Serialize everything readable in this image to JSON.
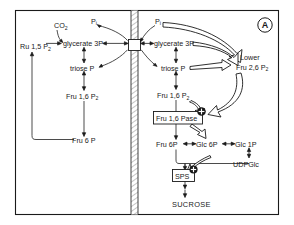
{
  "figure": {
    "panel_letter": "A",
    "title_text": "",
    "compartments": {
      "left_name": "chloroplast stroma",
      "right_name": "cytosol",
      "divider_name": "chloroplast envelope membrane"
    }
  },
  "metabolites": {
    "left": [
      {
        "id": "ru15p2",
        "label": "Ru 1,5 P",
        "sub": "2",
        "x": 20,
        "y": 46
      },
      {
        "id": "co2",
        "label": "CO",
        "sub": "2",
        "x": 56,
        "y": 26
      },
      {
        "id": "pi_left",
        "label": "P",
        "sub": "i",
        "x": 93,
        "y": 21
      },
      {
        "id": "glycerate3p_left",
        "label": "glycerate 3P",
        "sub": "",
        "x": 65,
        "y": 46
      },
      {
        "id": "triosep_left",
        "label": "triose P",
        "sub": "",
        "x": 74,
        "y": 70
      },
      {
        "id": "fru16p2_left",
        "label": "Fru 1,6 P",
        "sub": "2",
        "x": 72,
        "y": 98
      },
      {
        "id": "fru6p_left",
        "label": "Fru 6 P",
        "sub": "",
        "x": 76,
        "y": 142
      }
    ],
    "right": [
      {
        "id": "pi_right",
        "label": "P",
        "sub": "i",
        "x": 157,
        "y": 21
      },
      {
        "id": "glycerate3p_right",
        "label": "glycerate 3P",
        "sub": "",
        "x": 155,
        "y": 46
      },
      {
        "id": "triosep_right",
        "label": "triose P",
        "sub": "",
        "x": 163,
        "y": 70
      },
      {
        "id": "fru16p2_right",
        "label": "Fru 1,6 P",
        "sub": "2",
        "x": 163,
        "y": 97
      },
      {
        "id": "fru6p_right",
        "label": "Fru 6P",
        "sub": "",
        "x": 161,
        "y": 146
      },
      {
        "id": "glc6p",
        "label": "Glc 6P",
        "sub": "",
        "x": 199,
        "y": 146
      },
      {
        "id": "glc1p",
        "label": "Glc 1P",
        "sub": "",
        "x": 238,
        "y": 146
      },
      {
        "id": "udpglc",
        "label": "UDPGlc",
        "sub": "",
        "x": 235,
        "y": 164
      },
      {
        "id": "lower_label",
        "label": "Lower",
        "sub": "",
        "x": 242,
        "y": 57
      },
      {
        "id": "fru26p2",
        "label": "Fru 2,6 P",
        "sub": "2",
        "x": 238,
        "y": 67
      },
      {
        "id": "sucrose",
        "label": "SUCROSE",
        "sub": "",
        "x": 176,
        "y": 205
      }
    ]
  },
  "enzymes": [
    {
      "id": "fru16pase",
      "label": "Fru 1,6 Pase",
      "x": 160,
      "y": 118
    },
    {
      "id": "sps",
      "label": "SPS",
      "x": 177,
      "y": 175
    }
  ],
  "regulation": [
    {
      "id": "activation-fru16pase",
      "symbol": "+",
      "target": "Fru 1,6 Pase"
    },
    {
      "id": "activation-sps",
      "symbol": "+",
      "target": "SPS"
    }
  ],
  "colors": {
    "ink": "#1a1a1a",
    "line": "#2a2a2a",
    "background": "#ffffff"
  }
}
